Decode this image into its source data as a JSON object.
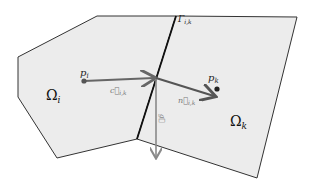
{
  "diagram": {
    "type": "finite-volume-cells",
    "colors": {
      "cell_fill": "#ececec",
      "cell_stroke": "#333333",
      "interface_stroke": "#111111",
      "vector_c": "#666666",
      "vector_n": "#555555",
      "vector_g": "#8a8a8a",
      "point": "#222222"
    },
    "cells": [
      {
        "id": "omega_i",
        "label": "Ω",
        "subscript": "i"
      },
      {
        "id": "omega_k",
        "label": "Ω",
        "subscript": "k"
      }
    ],
    "interface": {
      "label": "Γ",
      "subscript": "i,k"
    },
    "points": [
      {
        "id": "p_i",
        "label": "p",
        "subscript": "i"
      },
      {
        "id": "p_k",
        "label": "p",
        "subscript": "k"
      }
    ],
    "vectors": [
      {
        "id": "c_ik",
        "label": "c⃗",
        "subscript": "i,k"
      },
      {
        "id": "n_ik",
        "label": "n⃗",
        "subscript": "i,k"
      },
      {
        "id": "g",
        "label": "g⃗",
        "subscript": ""
      }
    ]
  }
}
